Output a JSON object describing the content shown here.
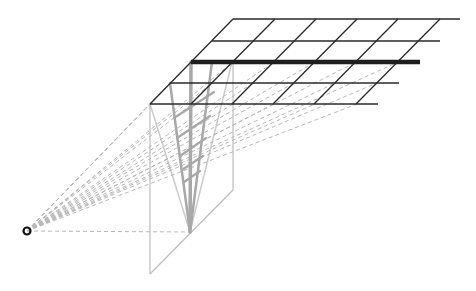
{
  "diagram": {
    "type": "perspective-projection",
    "colors": {
      "background": "#ffffff",
      "grid": "#2a2a2a",
      "highlight_row": "#1e1e1e",
      "sight_lines": "#b8b8b8",
      "picture_plane": "#bdbdbd",
      "projection": "#a8a8a8",
      "eye": "#111111"
    },
    "eye_point": {
      "x": 27,
      "y": 231
    },
    "ground_grid": {
      "rows": [
        {
          "y": 19,
          "x_start": 233,
          "x_end": 460
        },
        {
          "y": 41,
          "x_start": 212,
          "x_end": 440
        },
        {
          "y": 62,
          "x_start": 191,
          "x_end": 420,
          "highlighted": true
        },
        {
          "y": 83,
          "x_start": 170,
          "x_end": 399
        },
        {
          "y": 104,
          "x_start": 150,
          "x_end": 378
        }
      ],
      "column_top_x": [
        233,
        275,
        316,
        357,
        398,
        440
      ],
      "column_bottom_x": [
        150,
        191,
        232,
        273,
        314,
        356
      ],
      "cells": "5 columns x 4 rows"
    },
    "picture_plane": {
      "points": [
        [
          150,
          104
        ],
        [
          233,
          62
        ],
        [
          233,
          190
        ],
        [
          150,
          274
        ]
      ]
    },
    "projection_vanishing": {
      "x": 190,
      "y": 232
    }
  }
}
